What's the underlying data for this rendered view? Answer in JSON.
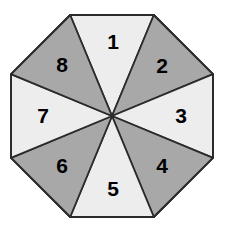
{
  "figure": {
    "name": "octagonal-spinner",
    "shape": "octagon",
    "sector_count": 8,
    "background_color": "#ffffff",
    "outline_color": "#2b2b2b",
    "outline_width": 1.8,
    "center": {
      "x": 112,
      "y": 116
    },
    "radius": 101,
    "colors": {
      "light_fill": "#ededed",
      "dark_fill": "#a8a8a8",
      "label_color": "#000000"
    },
    "sectors": [
      {
        "label": "1",
        "fill_tone": "light",
        "fill": "#ededed",
        "label_x": 113,
        "label_y": 43
      },
      {
        "label": "2",
        "fill_tone": "dark",
        "fill": "#a8a8a8",
        "label_x": 162,
        "label_y": 67
      },
      {
        "label": "3",
        "fill_tone": "light",
        "fill": "#ededed",
        "label_x": 181,
        "label_y": 117
      },
      {
        "label": "4",
        "fill_tone": "dark",
        "fill": "#a8a8a8",
        "label_x": 162,
        "label_y": 167
      },
      {
        "label": "5",
        "fill_tone": "light",
        "fill": "#ededed",
        "label_x": 113,
        "label_y": 190
      },
      {
        "label": "6",
        "fill_tone": "dark",
        "fill": "#a8a8a8",
        "label_x": 62,
        "label_y": 167
      },
      {
        "label": "7",
        "fill_tone": "light",
        "fill": "#ededed",
        "label_x": 43,
        "label_y": 117
      },
      {
        "label": "8",
        "fill_tone": "dark",
        "fill": "#a8a8a8",
        "label_x": 62,
        "label_y": 66
      }
    ]
  },
  "chart_data": {
    "type": "pie",
    "title": "",
    "categories": [
      "1",
      "2",
      "3",
      "4",
      "5",
      "6",
      "7",
      "8"
    ],
    "values": [
      12.5,
      12.5,
      12.5,
      12.5,
      12.5,
      12.5,
      12.5,
      12.5
    ],
    "unit": "percent",
    "slice_colors": [
      "#ededed",
      "#a8a8a8",
      "#ededed",
      "#a8a8a8",
      "#ededed",
      "#a8a8a8",
      "#ededed",
      "#a8a8a8"
    ],
    "legend": "none",
    "grid": false
  }
}
